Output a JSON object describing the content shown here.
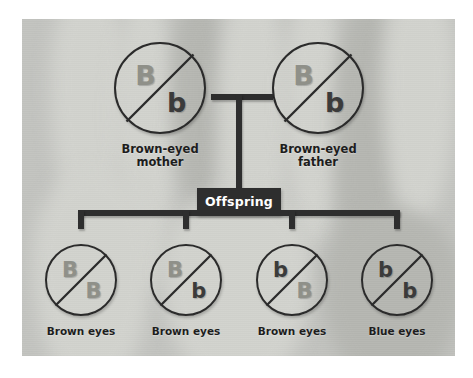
{
  "figure": {
    "background_color": "#c3c4c0",
    "line_color": "#2e2e2e",
    "dominant_allele_color": "#8f9089",
    "recessive_allele_color": "#3b3b3b"
  },
  "connector": {
    "offspring_label": "Offspring"
  },
  "parents": [
    {
      "name": "mother",
      "alleles": {
        "top": "B",
        "bottom": "b"
      },
      "genotype": "Bb",
      "caption_line1": "Brown-eyed",
      "caption_line2": "mother"
    },
    {
      "name": "father",
      "alleles": {
        "top": "B",
        "bottom": "b"
      },
      "genotype": "Bb",
      "caption_line1": "Brown-eyed",
      "caption_line2": "father"
    }
  ],
  "offspring": [
    {
      "name": "child-1",
      "alleles": {
        "top": "B",
        "bottom": "B"
      },
      "genotype": "BB",
      "caption": "Brown eyes"
    },
    {
      "name": "child-2",
      "alleles": {
        "top": "B",
        "bottom": "b"
      },
      "genotype": "Bb",
      "caption": "Brown eyes"
    },
    {
      "name": "child-3",
      "alleles": {
        "top": "b",
        "bottom": "B"
      },
      "genotype": "bB",
      "caption": "Brown eyes"
    },
    {
      "name": "child-4",
      "alleles": {
        "top": "b",
        "bottom": "b"
      },
      "genotype": "bb",
      "caption": "Blue eyes"
    }
  ]
}
